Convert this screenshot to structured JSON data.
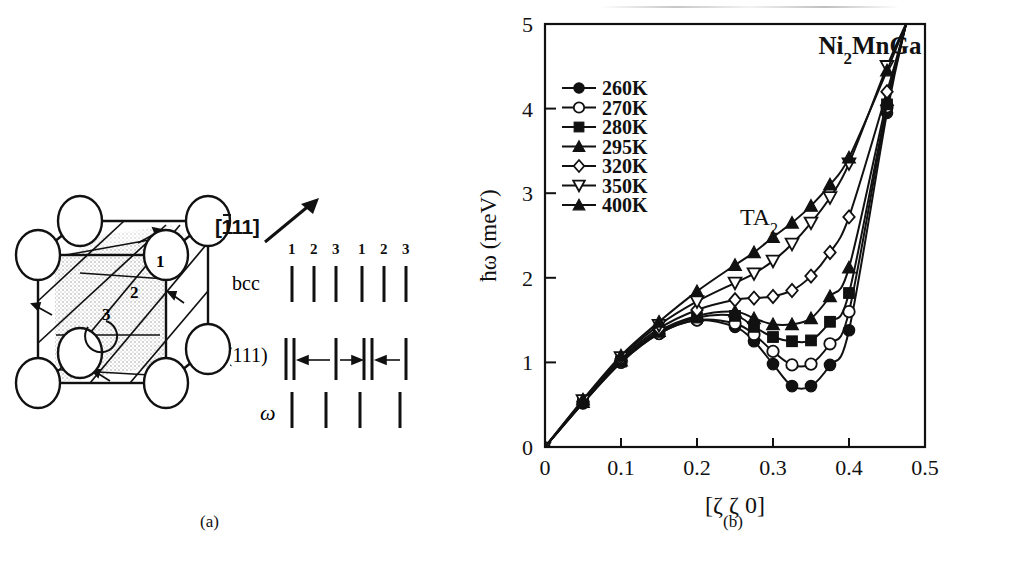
{
  "figure": {
    "panel_a": {
      "caption": "(a)",
      "direction_label_overline": "1",
      "direction_label_rest": "11",
      "direction_label_full": "[-111]",
      "index_labels": [
        "1",
        "2",
        "3",
        "1",
        "2",
        "3"
      ],
      "row_labels": {
        "bcc": "bcc",
        "modulated": "L⅔(111)",
        "omega": "ω"
      },
      "sphere_count": 9,
      "interior_labels": [
        "1",
        "2",
        "3"
      ]
    },
    "panel_b": {
      "caption": "(b)",
      "sample_label_main": "Ni",
      "sample_label_sub": "2",
      "sample_label_tail": "MnGa",
      "branch_label_main": "TA",
      "branch_label_sub": "2"
    }
  },
  "chart_data": {
    "type": "line",
    "title": "Ni2MnGa",
    "annotations": [
      "Ni2MnGa",
      "TA2"
    ],
    "xlabel": "[ζ ζ 0]",
    "ylabel": "ħω (meV)",
    "xlim": [
      0,
      0.5
    ],
    "ylim": [
      0,
      5
    ],
    "xticks": [
      0,
      0.1,
      0.2,
      0.3,
      0.4,
      0.5
    ],
    "xticklabels": [
      "0",
      "0.1",
      "0.2",
      "0.3",
      "0.4",
      "0.5"
    ],
    "yticks": [
      0,
      1,
      2,
      3,
      4,
      5
    ],
    "yticklabels": [
      "0",
      "1",
      "2",
      "3",
      "4",
      "5"
    ],
    "grid": false,
    "legend_position": "upper-left",
    "x": [
      0.0,
      0.05,
      0.1,
      0.15,
      0.2,
      0.25,
      0.3,
      0.325,
      0.35,
      0.375,
      0.4,
      0.425,
      0.45,
      0.475
    ],
    "series": [
      {
        "name": "260K",
        "label": "260K",
        "marker": "filled-circle",
        "x": [
          0.0,
          0.05,
          0.1,
          0.15,
          0.2,
          0.25,
          0.275,
          0.3,
          0.325,
          0.35,
          0.375,
          0.4,
          0.45,
          0.475
        ],
        "values": [
          0.0,
          0.52,
          1.0,
          1.34,
          1.5,
          1.42,
          1.25,
          0.98,
          0.72,
          0.72,
          0.97,
          1.38,
          3.95,
          5.0
        ]
      },
      {
        "name": "270K",
        "label": "270K",
        "marker": "open-circle",
        "x": [
          0.0,
          0.05,
          0.1,
          0.15,
          0.2,
          0.25,
          0.275,
          0.3,
          0.325,
          0.35,
          0.375,
          0.4,
          0.45,
          0.475
        ],
        "values": [
          0.0,
          0.52,
          1.0,
          1.34,
          1.5,
          1.46,
          1.33,
          1.13,
          0.97,
          0.98,
          1.22,
          1.6,
          4.02,
          5.0
        ]
      },
      {
        "name": "280K",
        "label": "280K",
        "marker": "filled-square",
        "x": [
          0.0,
          0.05,
          0.1,
          0.15,
          0.2,
          0.25,
          0.275,
          0.3,
          0.325,
          0.35,
          0.375,
          0.4,
          0.45,
          0.475
        ],
        "values": [
          0.0,
          0.53,
          1.01,
          1.36,
          1.53,
          1.55,
          1.42,
          1.3,
          1.25,
          1.26,
          1.48,
          1.82,
          4.05,
          5.0
        ]
      },
      {
        "name": "295K",
        "label": "295K",
        "marker": "filled-triangle-up",
        "x": [
          0.0,
          0.05,
          0.1,
          0.15,
          0.2,
          0.25,
          0.275,
          0.3,
          0.325,
          0.35,
          0.375,
          0.4,
          0.45,
          0.475
        ],
        "values": [
          0.0,
          0.53,
          1.02,
          1.37,
          1.55,
          1.6,
          1.52,
          1.45,
          1.45,
          1.52,
          1.78,
          2.12,
          4.1,
          5.0
        ]
      },
      {
        "name": "320K",
        "label": "320K",
        "marker": "open-diamond",
        "x": [
          0.0,
          0.05,
          0.1,
          0.15,
          0.2,
          0.25,
          0.275,
          0.3,
          0.325,
          0.35,
          0.375,
          0.4,
          0.45,
          0.475
        ],
        "values": [
          0.0,
          0.54,
          1.04,
          1.4,
          1.62,
          1.74,
          1.76,
          1.78,
          1.85,
          2.02,
          2.3,
          2.72,
          4.2,
          5.0
        ]
      },
      {
        "name": "350K",
        "label": "350K",
        "marker": "open-triangle-down",
        "x": [
          0.0,
          0.05,
          0.1,
          0.15,
          0.2,
          0.25,
          0.275,
          0.3,
          0.325,
          0.35,
          0.375,
          0.4,
          0.45,
          0.475
        ],
        "values": [
          0.0,
          0.55,
          1.06,
          1.44,
          1.72,
          1.94,
          2.05,
          2.2,
          2.4,
          2.65,
          2.95,
          3.35,
          4.5,
          5.0
        ]
      },
      {
        "name": "400K",
        "label": "400K",
        "marker": "filled-triangle-up",
        "x": [
          0.0,
          0.05,
          0.1,
          0.15,
          0.2,
          0.25,
          0.275,
          0.3,
          0.325,
          0.35,
          0.375,
          0.4,
          0.45,
          0.475
        ],
        "values": [
          0.0,
          0.56,
          1.08,
          1.48,
          1.84,
          2.15,
          2.3,
          2.48,
          2.65,
          2.85,
          3.1,
          3.42,
          4.45,
          5.0
        ]
      }
    ]
  },
  "colors": {
    "ink": "#111111",
    "paper": "#ffffff"
  }
}
